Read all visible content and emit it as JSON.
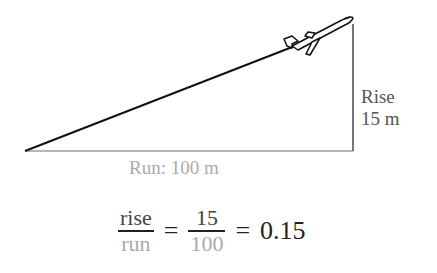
{
  "diagram": {
    "type": "slope-triangle",
    "labels": {
      "rise_line1": "Rise",
      "rise_line2": "15 m",
      "run": "Run: 100 m"
    },
    "icon": "airplane-icon",
    "colors": {
      "hypotenuse": "#111111",
      "rise_side": "#555555",
      "run_side": "#aaaaaa",
      "rise_text": "#555555",
      "run_text": "#aaaaaa"
    }
  },
  "equation": {
    "fraction1": {
      "numerator": "rise",
      "denominator": "run"
    },
    "equals1": "=",
    "fraction2": {
      "numerator": "15",
      "denominator": "100"
    },
    "equals2": "=",
    "result": "0.15"
  }
}
